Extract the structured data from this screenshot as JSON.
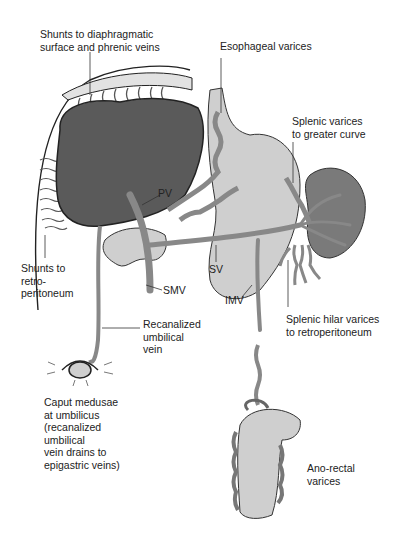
{
  "diagram": {
    "labels": {
      "shunts_diaphragm": [
        "Shunts to diaphragmatic",
        "surface and phrenic veins"
      ],
      "esophageal": "Esophageal varices",
      "splenic_greater": [
        "Splenic varices",
        "to greater curve"
      ],
      "pv": "PV",
      "sv": "SV",
      "smv": "SMV",
      "imv": "IMV",
      "shunts_retro": [
        "Shunts to",
        "retro-",
        "peritoneum"
      ],
      "splenic_hilar": [
        "Splenic hilar varices",
        "to retroperitoneum"
      ],
      "recanalized": [
        "Recanalized",
        "umbilical",
        "vein"
      ],
      "caput": [
        "Caput medusae",
        "at umbilicus",
        "(recanalized",
        "umbilical",
        "vein drains to",
        "epigastric veins)"
      ],
      "anorectal": [
        "Ano-rectal",
        "varices"
      ]
    },
    "colors": {
      "liver": "#5a5a5a",
      "vessel": "#8c8c8c",
      "organ_light": "#cfcfcf",
      "spleen": "#7a7a7a",
      "outline": "#222222"
    }
  }
}
